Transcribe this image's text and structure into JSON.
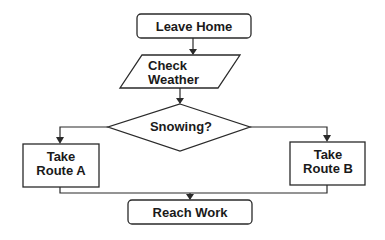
{
  "diagram": {
    "type": "flowchart",
    "nodes": {
      "leave_home": {
        "label": "Leave Home",
        "shape": "rounded-rectangle"
      },
      "check_weather": {
        "line1": "Check",
        "line2": "Weather",
        "shape": "parallelogram"
      },
      "snowing": {
        "label": "Snowing?",
        "shape": "diamond"
      },
      "route_a": {
        "line1": "Take",
        "line2": "Route A",
        "shape": "rectangle"
      },
      "route_b": {
        "line1": "Take",
        "line2": "Route B",
        "shape": "rectangle"
      },
      "reach_work": {
        "label": "Reach Work",
        "shape": "rounded-rectangle"
      }
    },
    "edges": [
      {
        "from": "Leave Home",
        "to": "Check Weather"
      },
      {
        "from": "Check Weather",
        "to": "Snowing?"
      },
      {
        "from": "Snowing?",
        "to": "Take Route A"
      },
      {
        "from": "Snowing?",
        "to": "Take Route B"
      },
      {
        "from": "Take Route A",
        "to": "Reach Work"
      },
      {
        "from": "Take Route B",
        "to": "Reach Work"
      }
    ],
    "colors": {
      "stroke": "#2a2a2a",
      "text": "#1a1a1a",
      "background": "#ffffff"
    }
  }
}
